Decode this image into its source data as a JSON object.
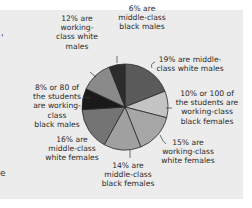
{
  "chart_data": {
    "type": "pie",
    "title": "",
    "start_angle": "12 o'clock, clockwise",
    "slices": [
      {
        "label": "19% are middle-class white males",
        "value": 19,
        "color": "#5a5a5a"
      },
      {
        "label": "10% or 100 of the students are working-class black females",
        "value": 10,
        "color": "#c4c4c4"
      },
      {
        "label": "15% are working-class white females",
        "value": 15,
        "color": "#a6a6a6"
      },
      {
        "label": "14% are middle-class black females",
        "value": 14,
        "color": "#a0a0a0"
      },
      {
        "label": "16% are middle-class white females",
        "value": 16,
        "color": "#747474"
      },
      {
        "label": "8% or 80 of the students are working-class black males",
        "value": 8,
        "color": "#1a1a1a"
      },
      {
        "label": "12% are working-class white males",
        "value": 12,
        "color": "#8a8a8a"
      },
      {
        "label": "6% are middle-class black males",
        "value": 6,
        "color": "#2c2c2c"
      }
    ],
    "categories": [
      "middle-class white males",
      "working-class black females",
      "working-class white females",
      "middle-class black females",
      "middle-class white females",
      "working-class black males",
      "working-class white males",
      "middle-class black males"
    ],
    "values": [
      19,
      10,
      15,
      14,
      16,
      8,
      12,
      6
    ]
  },
  "labels": {
    "mc_white_males": "19% are middle-\nclass white males",
    "wc_black_females": "10% or 100 of\nthe students are\nworking-class\nblack females",
    "wc_white_females": "15% are\nworking-class\nwhite females",
    "mc_black_females": "14% are\nmiddle-class\nblack females",
    "mc_white_females": "16% are\nmiddle-class\nwhite females",
    "wc_black_males": "8% or 80 of\nthe students\nare working-class\nblack males",
    "wc_white_males": "12% are\nworking-\nclass white\nmales",
    "mc_black_males": "6% are\nmiddle-class\nblack males"
  },
  "fragments": {
    "top_left": "'",
    "bottom_left": "e"
  }
}
